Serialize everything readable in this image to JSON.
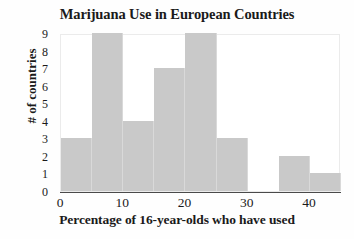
{
  "chart_data": {
    "type": "bar",
    "title": "Marijuana Use in European Countries",
    "xlabel": "Percentage of 16-year-olds who have used",
    "ylabel": "# of countries",
    "bin_width": 5,
    "bin_edges": [
      0,
      5,
      10,
      15,
      20,
      25,
      30,
      35,
      40,
      45
    ],
    "categories": [
      "0-5",
      "5-10",
      "10-15",
      "15-20",
      "20-25",
      "25-30",
      "30-35",
      "35-40",
      "40-45"
    ],
    "values": [
      3,
      9,
      4,
      7,
      9,
      3,
      0,
      2,
      1
    ],
    "xlim": [
      0,
      45
    ],
    "ylim": [
      0,
      9
    ],
    "xticks": [
      0,
      10,
      20,
      30,
      40
    ],
    "xtick_labels": [
      "0",
      "10",
      "20",
      "30",
      "40"
    ],
    "yticks": [
      0,
      1,
      2,
      3,
      4,
      5,
      6,
      7,
      8,
      9
    ],
    "ytick_labels": [
      "0",
      "1",
      "2",
      "3",
      "4",
      "5",
      "6",
      "7",
      "8",
      "9"
    ],
    "grid": false,
    "legend": null,
    "bar_color": "#c9c9c9",
    "bar_edge_color": "#d9d9d9",
    "axis_color": "#4a4a4a",
    "text_color": "#1a1a1a",
    "background": "#ffffff"
  }
}
